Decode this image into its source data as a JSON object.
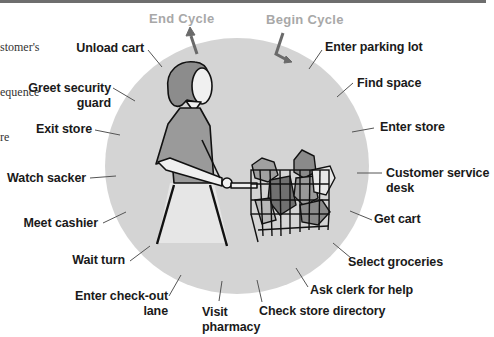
{
  "caption": {
    "lines": [
      "stomer's",
      "equence",
      "re"
    ]
  },
  "cycle": {
    "end_label": "End Cycle",
    "begin_label": "Begin Cycle"
  },
  "colors": {
    "circle_fill": "#d4d4d4",
    "cycle_label": "#a8a8a8",
    "label_text": "#1a1a1a",
    "leader_line": "#555555",
    "shirt": "#9a9a9a",
    "hair": "#8c8c8c"
  },
  "steps": [
    {
      "label": "Enter parking lot"
    },
    {
      "label": "Find space"
    },
    {
      "label": "Enter store"
    },
    {
      "label": "Customer service",
      "label2": "desk"
    },
    {
      "label": "Get cart"
    },
    {
      "label": "Select groceries"
    },
    {
      "label": "Ask clerk for help"
    },
    {
      "label": "Check store directory"
    },
    {
      "label": "Visit",
      "label2": "pharmacy"
    },
    {
      "label": "Enter check-out",
      "label2": "lane"
    },
    {
      "label": "Wait turn"
    },
    {
      "label": "Meet cashier"
    },
    {
      "label": "Watch sacker"
    },
    {
      "label": "Exit store"
    },
    {
      "label": "Greet security",
      "label2": "guard"
    },
    {
      "label": "Unload cart"
    }
  ]
}
